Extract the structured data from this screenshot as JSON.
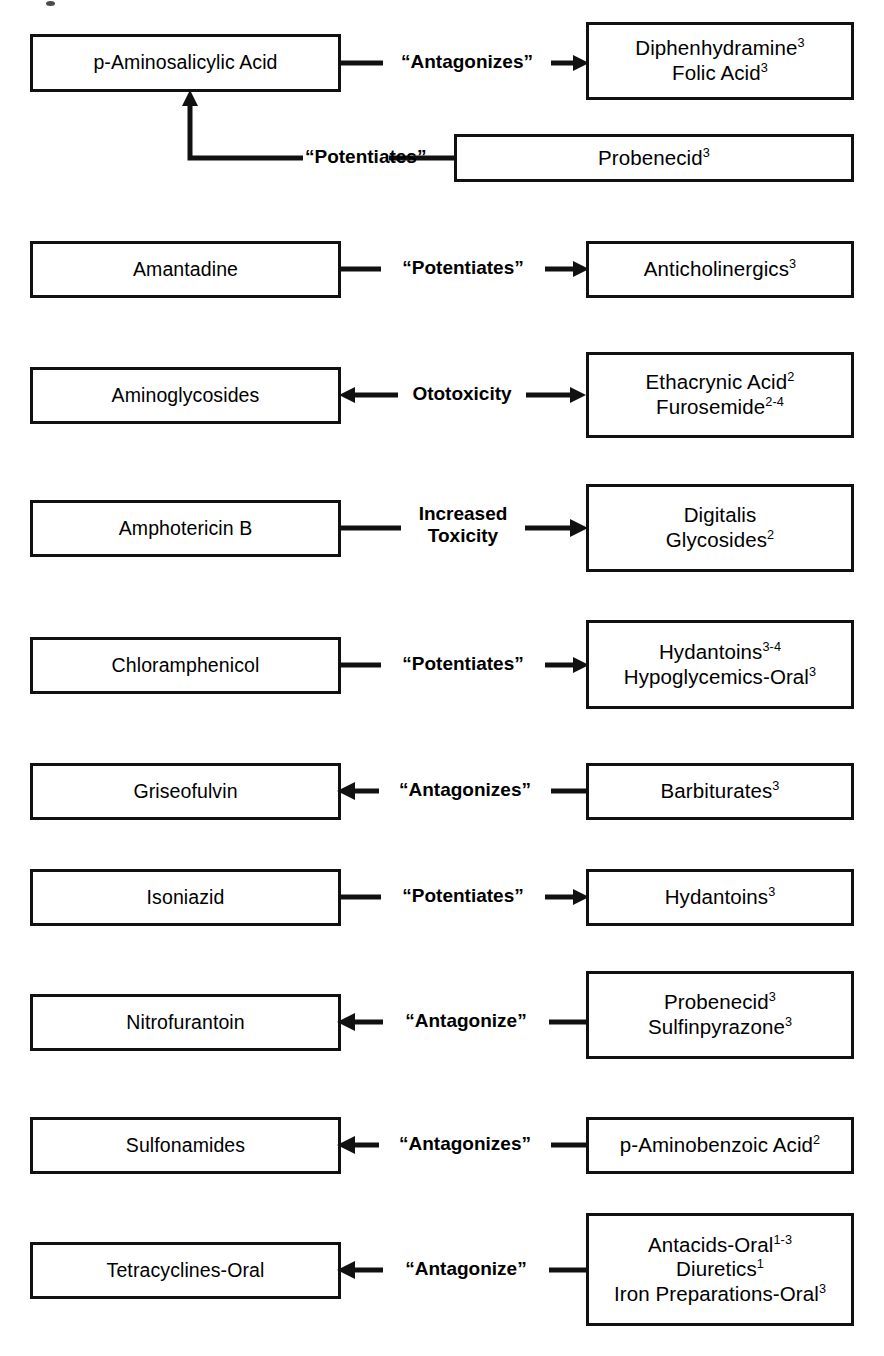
{
  "page": {
    "background_color": "#ffffff",
    "stroke_color": "#111111"
  },
  "rows": [
    {
      "id": "p-aminosalicylic-acid",
      "left": {
        "lines": [
          "p-Aminosalicylic Acid"
        ]
      },
      "label": "“Antagonizes”",
      "arrow": "right",
      "right": {
        "lines": [
          {
            "text": "Diphenhydramine",
            "sup": "3"
          },
          {
            "text": "Folic Acid",
            "sup": "3"
          }
        ]
      }
    },
    {
      "id": "probenecid-potentiates-pas",
      "left": null,
      "label": "“Potentiates”",
      "arrow": "elbow-up-left",
      "right": {
        "lines": [
          {
            "text": "Probenecid",
            "sup": "3"
          }
        ]
      }
    },
    {
      "id": "amantadine",
      "left": {
        "lines": [
          "Amantadine"
        ]
      },
      "label": "“Potentiates”",
      "arrow": "right",
      "right": {
        "lines": [
          {
            "text": "Anticholinergics",
            "sup": "3"
          }
        ]
      }
    },
    {
      "id": "aminoglycosides",
      "left": {
        "lines": [
          "Aminoglycosides"
        ]
      },
      "label": "Ototoxicity",
      "arrow": "both",
      "right": {
        "lines": [
          {
            "text": "Ethacrynic Acid",
            "sup": "2"
          },
          {
            "text": "Furosemide",
            "sup": "2-4"
          }
        ]
      }
    },
    {
      "id": "amphotericin-b",
      "left": {
        "lines": [
          "Amphotericin B"
        ]
      },
      "label": "Increased\nToxicity",
      "arrow": "right",
      "right": {
        "lines": [
          {
            "text": "Digitalis",
            "sup": ""
          },
          {
            "text": "Glycosides",
            "sup": "2"
          }
        ]
      }
    },
    {
      "id": "chloramphenicol",
      "left": {
        "lines": [
          "Chloramphenicol"
        ]
      },
      "label": "“Potentiates”",
      "arrow": "right",
      "right": {
        "lines": [
          {
            "text": "Hydantoins",
            "sup": "3-4"
          },
          {
            "text": "Hypoglycemics-Oral",
            "sup": "3"
          }
        ]
      }
    },
    {
      "id": "griseofulvin",
      "left": {
        "lines": [
          "Griseofulvin"
        ]
      },
      "label": "“Antagonizes”",
      "arrow": "left",
      "right": {
        "lines": [
          {
            "text": "Barbiturates",
            "sup": "3"
          }
        ]
      }
    },
    {
      "id": "isoniazid",
      "left": {
        "lines": [
          "Isoniazid"
        ]
      },
      "label": "“Potentiates”",
      "arrow": "right",
      "right": {
        "lines": [
          {
            "text": "Hydantoins",
            "sup": "3"
          }
        ]
      }
    },
    {
      "id": "nitrofurantoin",
      "left": {
        "lines": [
          "Nitrofurantoin"
        ]
      },
      "label": "“Antagonize”",
      "arrow": "left",
      "right": {
        "lines": [
          {
            "text": "Probenecid",
            "sup": "3"
          },
          {
            "text": "Sulfinpyrazone",
            "sup": "3"
          }
        ]
      }
    },
    {
      "id": "sulfonamides",
      "left": {
        "lines": [
          "Sulfonamides"
        ]
      },
      "label": "“Antagonizes”",
      "arrow": "left",
      "right": {
        "lines": [
          {
            "text": "p-Aminobenzoic Acid",
            "sup": "2"
          }
        ]
      }
    },
    {
      "id": "tetracyclines-oral",
      "left": {
        "lines": [
          "Tetracyclines-Oral"
        ]
      },
      "label": "“Antagonize”",
      "arrow": "left",
      "right": {
        "lines": [
          {
            "text": "Antacids-Oral",
            "sup": "1-3"
          },
          {
            "text": "Diuretics",
            "sup": "1"
          },
          {
            "text": "Iron Preparations-Oral",
            "sup": "3"
          }
        ]
      }
    }
  ],
  "boxes": {
    "pas": {
      "x": 30,
      "y": 34,
      "w": 311,
      "h": 58
    },
    "diphenhydramine": {
      "x": 586,
      "y": 22,
      "w": 268,
      "h": 78
    },
    "probenecid_top": {
      "x": 454,
      "y": 134,
      "w": 400,
      "h": 48
    },
    "amantadine": {
      "x": 30,
      "y": 241,
      "w": 311,
      "h": 57
    },
    "anticholinergics": {
      "x": 586,
      "y": 241,
      "w": 268,
      "h": 57
    },
    "aminoglycosides": {
      "x": 30,
      "y": 367,
      "w": 311,
      "h": 57
    },
    "ethacrynic": {
      "x": 586,
      "y": 352,
      "w": 268,
      "h": 86
    },
    "amphotericin": {
      "x": 30,
      "y": 500,
      "w": 311,
      "h": 57
    },
    "digitalis": {
      "x": 586,
      "y": 484,
      "w": 268,
      "h": 88
    },
    "chloramphenicol": {
      "x": 30,
      "y": 637,
      "w": 311,
      "h": 57
    },
    "hydantoins34": {
      "x": 586,
      "y": 620,
      "w": 268,
      "h": 89
    },
    "griseofulvin": {
      "x": 30,
      "y": 763,
      "w": 311,
      "h": 57
    },
    "barbiturates": {
      "x": 586,
      "y": 763,
      "w": 268,
      "h": 57
    },
    "isoniazid": {
      "x": 30,
      "y": 869,
      "w": 311,
      "h": 57
    },
    "hydantoins3": {
      "x": 586,
      "y": 869,
      "w": 268,
      "h": 57
    },
    "nitrofurantoin": {
      "x": 30,
      "y": 994,
      "w": 311,
      "h": 57
    },
    "probenecid_sulfin": {
      "x": 586,
      "y": 971,
      "w": 268,
      "h": 88
    },
    "sulfonamides": {
      "x": 30,
      "y": 1117,
      "w": 311,
      "h": 57
    },
    "paba": {
      "x": 586,
      "y": 1117,
      "w": 268,
      "h": 57
    },
    "tetracyclines": {
      "x": 30,
      "y": 1242,
      "w": 311,
      "h": 57
    },
    "antacids": {
      "x": 586,
      "y": 1213,
      "w": 268,
      "h": 113
    }
  }
}
